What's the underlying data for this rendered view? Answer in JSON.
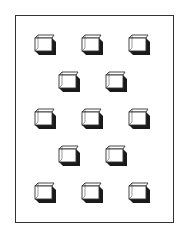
{
  "figure": {
    "colors": {
      "outline": "#333333",
      "shadow": "#1a1a1a",
      "face": "#ffffff"
    },
    "rows": [
      {
        "count": 3,
        "cubes": [
          {
            "x": 33,
            "y": 34
          },
          {
            "x": 80,
            "y": 34
          },
          {
            "x": 127,
            "y": 34
          }
        ]
      },
      {
        "count": 2,
        "cubes": [
          {
            "x": 57,
            "y": 71
          },
          {
            "x": 104,
            "y": 71
          }
        ]
      },
      {
        "count": 3,
        "cubes": [
          {
            "x": 33,
            "y": 108
          },
          {
            "x": 80,
            "y": 108
          },
          {
            "x": 127,
            "y": 108
          }
        ]
      },
      {
        "count": 2,
        "cubes": [
          {
            "x": 57,
            "y": 145
          },
          {
            "x": 104,
            "y": 145
          }
        ]
      },
      {
        "count": 3,
        "cubes": [
          {
            "x": 33,
            "y": 182
          },
          {
            "x": 80,
            "y": 182
          },
          {
            "x": 127,
            "y": 182
          }
        ]
      }
    ],
    "total_cubes": 13
  }
}
